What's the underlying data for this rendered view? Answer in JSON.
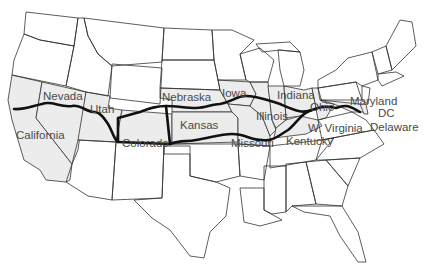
{
  "map": {
    "title": "US route map",
    "highlight_color": "#ececec",
    "route_color": "#111111",
    "border_color": "#333333",
    "states_labeled": [
      {
        "name": "Nevada",
        "x": 43,
        "y": 91
      },
      {
        "name": "Utah",
        "x": 90,
        "y": 104
      },
      {
        "name": "California",
        "x": 16,
        "y": 130
      },
      {
        "name": "Colorado",
        "x": 122,
        "y": 138
      },
      {
        "name": "Nebraska",
        "x": 162,
        "y": 92
      },
      {
        "name": "Kansas",
        "x": 180,
        "y": 120
      },
      {
        "name": "Iowa",
        "x": 222,
        "y": 88
      },
      {
        "name": "Illinois",
        "x": 256,
        "y": 111
      },
      {
        "name": "Missouri",
        "x": 231,
        "y": 138
      },
      {
        "name": "Indiana",
        "x": 277,
        "y": 90
      },
      {
        "name": "Kentucky",
        "x": 286,
        "y": 136
      },
      {
        "name": "Ohio",
        "x": 310,
        "y": 102
      },
      {
        "name": "W. Virginia",
        "x": 308,
        "y": 123
      },
      {
        "name": "Maryland",
        "x": 350,
        "y": 96
      },
      {
        "name": "DC",
        "x": 378,
        "y": 108
      },
      {
        "name": "Delaware",
        "x": 370,
        "y": 122
      }
    ]
  }
}
